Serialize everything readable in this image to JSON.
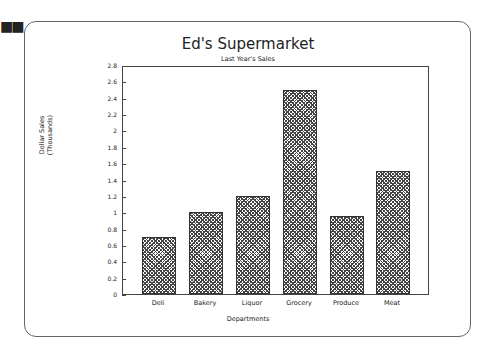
{
  "decor": {
    "dots": "■■"
  },
  "chart_data": {
    "type": "bar",
    "title": "Ed's Supermarket",
    "subtitle": "Last Year's Sales",
    "xlabel": "Departments",
    "ylabel": "Dollar Sales (Thousands)",
    "ylabel_lines": [
      "Dollar Sales",
      "(Thousands)"
    ],
    "categories": [
      "Deli",
      "Bakery",
      "Liquor",
      "Grocery",
      "Produce",
      "Meat"
    ],
    "values": [
      0.7,
      1.0,
      1.2,
      2.5,
      0.95,
      1.5
    ],
    "ylim": [
      0,
      2.8
    ],
    "yticks": [
      "0",
      "0.2",
      "0.4",
      "0.6",
      "0.8",
      "1",
      "1.2",
      "1.4",
      "1.6",
      "1.8",
      "2",
      "2.2",
      "2.4",
      "2.6",
      "2.8"
    ],
    "grid": false,
    "legend": "none",
    "bar_fill": "crosshatch",
    "bar_color": "#444444"
  }
}
